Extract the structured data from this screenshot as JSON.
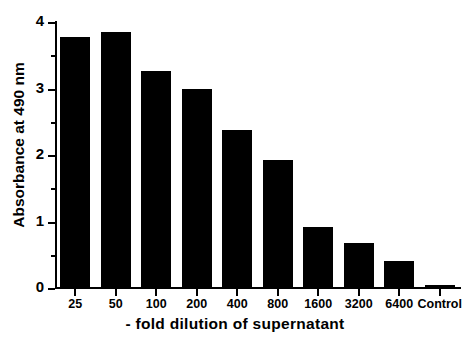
{
  "chart_data": {
    "type": "bar",
    "title": "",
    "xlabel": "- fold dilution of supernatant",
    "ylabel": "Absorbance at 490 nm",
    "categories": [
      "25",
      "50",
      "100",
      "200",
      "400",
      "800",
      "1600",
      "3200",
      "6400",
      "Control"
    ],
    "values": [
      3.78,
      3.85,
      3.27,
      3.0,
      2.38,
      1.93,
      0.92,
      0.68,
      0.4,
      0.05
    ],
    "ylim": [
      0,
      4
    ],
    "ytick_labels": [
      "0",
      "1",
      "2",
      "3",
      "4"
    ],
    "ytick_values": [
      0,
      1,
      2,
      3,
      4
    ],
    "yminor_values": [
      0.5,
      1.5,
      2.5,
      3.5
    ],
    "grid": false,
    "legend": false,
    "bar_color": "#000000",
    "background_color": "#ffffff",
    "axis_color": "#000000"
  },
  "figure": {
    "ylabel": "Absorbance at 490 nm",
    "xlabel": "- fold dilution of supernatant"
  }
}
